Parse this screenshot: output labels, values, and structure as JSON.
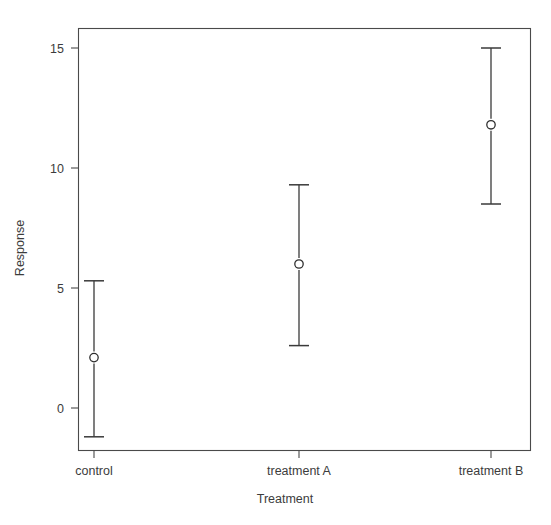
{
  "chart_data": {
    "type": "scatter",
    "title": "",
    "xlabel": "Treatment",
    "ylabel": "Response",
    "categories": [
      "control",
      "treatment A",
      "treatment B"
    ],
    "values": [
      2.1,
      6.0,
      11.8
    ],
    "error_low": [
      -1.2,
      2.6,
      8.5
    ],
    "error_high": [
      5.3,
      9.3,
      15.0
    ],
    "series": [
      {
        "name": "Response",
        "points": [
          {
            "category": "control",
            "value": 2.1,
            "low": -1.2,
            "high": 5.3
          },
          {
            "category": "treatment A",
            "value": 6.0,
            "low": 2.6,
            "high": 9.3
          },
          {
            "category": "treatment B",
            "value": 11.8,
            "low": 8.5,
            "high": 15.0
          }
        ]
      }
    ],
    "ylim": [
      -2.0,
      15.9
    ],
    "xlim": [
      0,
      4
    ],
    "yticks": [
      0,
      5,
      10,
      15
    ],
    "ytick_labels": [
      "0",
      "5",
      "10",
      "15"
    ],
    "xtick_labels": [
      "control",
      "treatment A",
      "treatment B"
    ],
    "grid": false,
    "legend": false,
    "legend_position": "none",
    "marker": "open-circle",
    "error_bar_style": "capped",
    "colors": {
      "line": "#3a3a3a",
      "axis": "#4a4a4a",
      "marker_fill": "#ffffff",
      "marker_stroke": "#2e2e2e",
      "text": "#3c3c3c",
      "background": "#ffffff"
    }
  },
  "axis": {
    "y_title": "Response",
    "x_title": "Treatment",
    "y_tick_0": "0",
    "y_tick_1": "5",
    "y_tick_2": "10",
    "y_tick_3": "15",
    "x_tick_0": "control",
    "x_tick_1": "treatment A",
    "x_tick_2": "treatment B"
  }
}
